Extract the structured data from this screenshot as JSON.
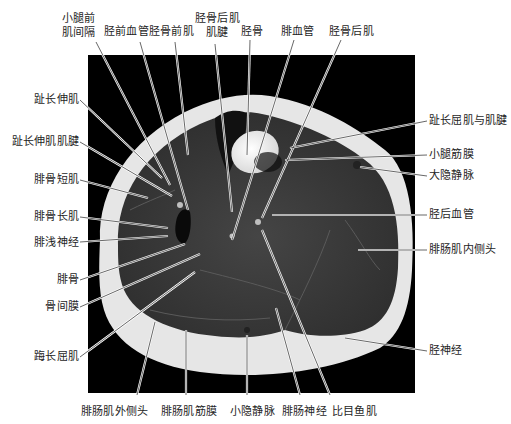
{
  "figure": {
    "type": "MRI axial cross-section of lower leg (calf), T1-weighted",
    "background_color": "#000000",
    "fat_color": "#e8e8e8",
    "muscle_color": "#3a3a3a",
    "leader_line_color": "#ffffff"
  },
  "labels": {
    "top": [
      {
        "id": "anterior-intermuscular-septum",
        "lines": [
          "小腿前",
          "肌间隔"
        ]
      },
      {
        "id": "anterior-tibial-vessels",
        "lines": [
          "胫前血管"
        ]
      },
      {
        "id": "tibialis-anterior",
        "lines": [
          "胫骨前肌"
        ]
      },
      {
        "id": "tibialis-posterior-tendon",
        "lines": [
          "胫骨后肌",
          "肌腱"
        ]
      },
      {
        "id": "tibia",
        "lines": [
          "胫骨"
        ]
      },
      {
        "id": "peroneal-vessels",
        "lines": [
          "腓血管"
        ]
      },
      {
        "id": "tibialis-posterior",
        "lines": [
          "胫骨后肌"
        ]
      }
    ],
    "left": [
      {
        "id": "extensor-digitorum-longus",
        "text": "趾长伸肌"
      },
      {
        "id": "extensor-digitorum-longus-tendon",
        "text": "趾长伸肌肌腱"
      },
      {
        "id": "peroneus-brevis",
        "text": "腓骨短肌"
      },
      {
        "id": "peroneus-longus",
        "text": "腓骨长肌"
      },
      {
        "id": "superficial-peroneal-nerve",
        "text": "腓浅神经"
      },
      {
        "id": "fibula",
        "text": "腓骨"
      },
      {
        "id": "interosseous-membrane",
        "text": "骨间膜"
      },
      {
        "id": "flexor-hallucis-longus",
        "text": "踇长屈肌"
      }
    ],
    "right": [
      {
        "id": "flexor-digitorum-longus",
        "text": "趾长屈肌与肌腱"
      },
      {
        "id": "crural-fascia",
        "text": "小腿筋膜"
      },
      {
        "id": "great-saphenous-vein",
        "text": "大隐静脉"
      },
      {
        "id": "posterior-tibial-vessels",
        "text": "胫后血管"
      },
      {
        "id": "gastrocnemius-medial-head",
        "text": "腓肠肌内侧头"
      },
      {
        "id": "tibial-nerve",
        "text": "胫神经"
      }
    ],
    "bottom": [
      {
        "id": "gastrocnemius-lateral-head",
        "text": "腓肠肌外侧头"
      },
      {
        "id": "gastrocnemius-fascia",
        "text": "腓肠肌筋膜"
      },
      {
        "id": "small-saphenous-vein",
        "text": "小隐静脉"
      },
      {
        "id": "sural-nerve",
        "text": "腓肠神经"
      },
      {
        "id": "soleus",
        "text": "比目鱼肌"
      }
    ]
  }
}
